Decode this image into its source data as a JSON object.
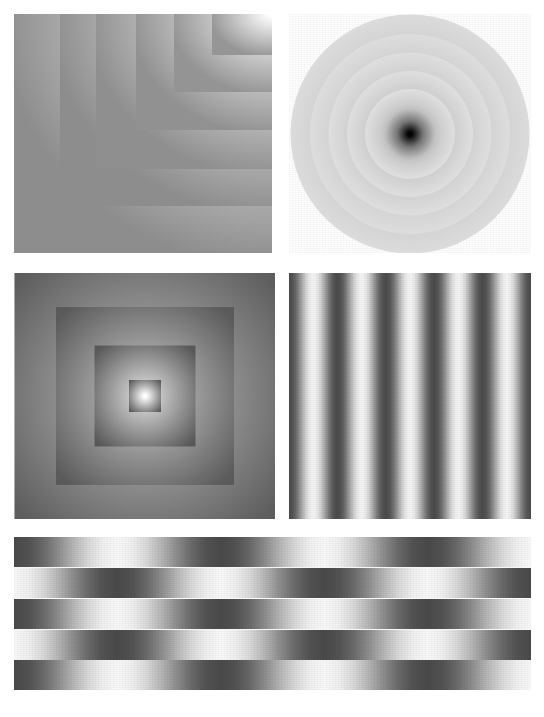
{
  "figure": {
    "background_color": "#ffffff",
    "width": 544,
    "height": 717,
    "panel_count": 5,
    "palette": {
      "black": "#000000",
      "near_black": "#1a1a1a",
      "dark_gray": "#5a5a5a",
      "mid_gray": "#8a8a8a",
      "light_gray": "#c8c8c8",
      "white": "#ffffff"
    }
  },
  "chart_data": [
    {
      "type": "heatmap",
      "id": "panel-corner-squares",
      "title": "Nested corner-anchored square gradients",
      "description": "Five concentric square regions anchored at the top-right corner; each region is filled with a radial gradient that is white at the top-right corner and darkens toward the lower-left.",
      "layout": {
        "x": 14,
        "y": 14,
        "width": 258,
        "height": 239
      },
      "gradient_origin": "top-right",
      "grid": false,
      "legend": "none",
      "xlabel": "",
      "ylabel": "",
      "layers": [
        {
          "index": 0,
          "width": 258,
          "height": 239,
          "inner_color": "#ffffff",
          "outer_color": "#8d8d8d"
        },
        {
          "index": 1,
          "width": 212,
          "height": 192,
          "inner_color": "#ffffff",
          "outer_color": "#8d8d8d"
        },
        {
          "index": 2,
          "width": 176,
          "height": 155,
          "inner_color": "#ffffff",
          "outer_color": "#8f8f8f"
        },
        {
          "index": 3,
          "width": 136,
          "height": 116,
          "inner_color": "#ffffff",
          "outer_color": "#919191"
        },
        {
          "index": 4,
          "width": 98,
          "height": 78,
          "inner_color": "#ffffff",
          "outer_color": "#949494"
        },
        {
          "index": 5,
          "width": 60,
          "height": 41,
          "inner_color": "#ffffff",
          "outer_color": "#969696"
        }
      ]
    },
    {
      "type": "heatmap",
      "id": "panel-concentric-circles",
      "title": "Concentric radial ring gradients",
      "description": "A circular disc containing six concentric annular rings; each ring fades from light at its outer edge to darker at its inner edge, with a near-black point at the exact center.",
      "layout": {
        "x": 289,
        "y": 14,
        "width": 242,
        "height": 239
      },
      "gradient_origin": "center",
      "ring_count": 6,
      "center_color": "#050505",
      "outer_color": "#ffffff",
      "grid": false,
      "legend": "none",
      "xlabel": "",
      "ylabel": "",
      "rings": [
        {
          "index": 0,
          "diameter": 239,
          "edge_color": "#e9e9e9",
          "inner_color": "#b4b4b4"
        },
        {
          "index": 1,
          "diameter": 200,
          "edge_color": "#ececec",
          "inner_color": "#b2b2b2"
        },
        {
          "index": 2,
          "diameter": 163,
          "edge_color": "#eeeeee",
          "inner_color": "#ababab"
        },
        {
          "index": 3,
          "diameter": 126,
          "edge_color": "#efefef",
          "inner_color": "#a0a0a0"
        },
        {
          "index": 4,
          "diameter": 90,
          "edge_color": "#f0f0f0",
          "inner_color": "#8e8e8e"
        },
        {
          "index": 5,
          "diameter": 54,
          "edge_color": "#efefef",
          "inner_color": "#050505"
        }
      ]
    },
    {
      "type": "heatmap",
      "id": "panel-nested-squares",
      "title": "Nested centered square gradients",
      "description": "Four nested centered square regions; each square is dark at its border and brightens toward its own centre, producing a stepped bright core at the middle of the panel.",
      "layout": {
        "x": 14,
        "y": 273,
        "width": 261,
        "height": 246
      },
      "gradient_origin": "center",
      "square_count": 4,
      "center_color": "#ffffff",
      "edge_color": "#5f5f5f",
      "grid": false,
      "legend": "none",
      "xlabel": "",
      "ylabel": "",
      "squares": [
        {
          "index": 0,
          "size": 261,
          "edge_color": "#5d5d5d",
          "center_color": "#b8b8b8"
        },
        {
          "index": 1,
          "size": 178,
          "edge_color": "#5a5a5a",
          "center_color": "#c6c6c6"
        },
        {
          "index": 2,
          "size": 101,
          "edge_color": "#585858",
          "center_color": "#dcdcdc"
        },
        {
          "index": 3,
          "size": 32,
          "edge_color": "#5a5a5a",
          "center_color": "#ffffff"
        }
      ]
    },
    {
      "type": "heatmap",
      "id": "panel-vertical-stripes",
      "title": "Vertical sinusoidal stripe gradient",
      "description": "A square field of vertical stripes whose luminance cycles smoothly from dark to light roughly five times across the width.",
      "layout": {
        "x": 289,
        "y": 273,
        "width": 242,
        "height": 246
      },
      "orientation": "vertical",
      "cycle_count": 5,
      "cycle_width_px": 48,
      "dark_color": "#4b4b4b",
      "light_color": "#f7f7f7",
      "grid": false,
      "legend": "none",
      "xlabel": "",
      "ylabel": ""
    },
    {
      "type": "heatmap",
      "id": "panel-horizontal-bands",
      "title": "Phase-shifted horizontal band gradients",
      "description": "Five stacked horizontal bands spanning the full figure width. Each band carries a horizontal dark-to-light gradient cycling about two and a half times; consecutive bands are shifted 180 degrees out of phase so dark and light columns interleave vertically.",
      "layout": {
        "x": 14,
        "y": 537,
        "width": 517,
        "height": 153
      },
      "orientation": "horizontal",
      "band_count": 5,
      "band_height_px": 30,
      "cycle_count": 2.5,
      "dark_color": "#4a4a4a",
      "light_color": "#fafafa",
      "grid": false,
      "legend": "none",
      "xlabel": "",
      "ylabel": "",
      "bands": [
        {
          "index": 0,
          "top": 0,
          "height": 30,
          "phase": "dark-start",
          "start_color": "#4a4a4a",
          "end_color": "#fafafa"
        },
        {
          "index": 1,
          "top": 31,
          "height": 30,
          "phase": "light-start",
          "start_color": "#fafafa",
          "end_color": "#4a4a4a"
        },
        {
          "index": 2,
          "top": 62,
          "height": 30,
          "phase": "dark-start",
          "start_color": "#4a4a4a",
          "end_color": "#fafafa"
        },
        {
          "index": 3,
          "top": 93,
          "height": 30,
          "phase": "light-start",
          "start_color": "#fafafa",
          "end_color": "#4a4a4a"
        },
        {
          "index": 4,
          "top": 123,
          "height": 30,
          "phase": "dark-start",
          "start_color": "#4a4a4a",
          "end_color": "#fafafa"
        }
      ]
    }
  ]
}
